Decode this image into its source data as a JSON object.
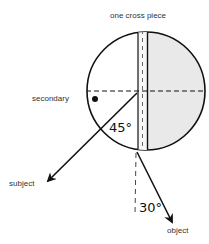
{
  "diagram": {
    "labels": {
      "top": "one cross piece",
      "left": "secondary",
      "subject": "subject",
      "object": "object"
    },
    "angles": {
      "subject_angle": "45°",
      "object_angle": "30°"
    },
    "colors": {
      "stroke": "#111111",
      "shaded_half": "#e8e8e8",
      "background": "#ffffff"
    }
  }
}
